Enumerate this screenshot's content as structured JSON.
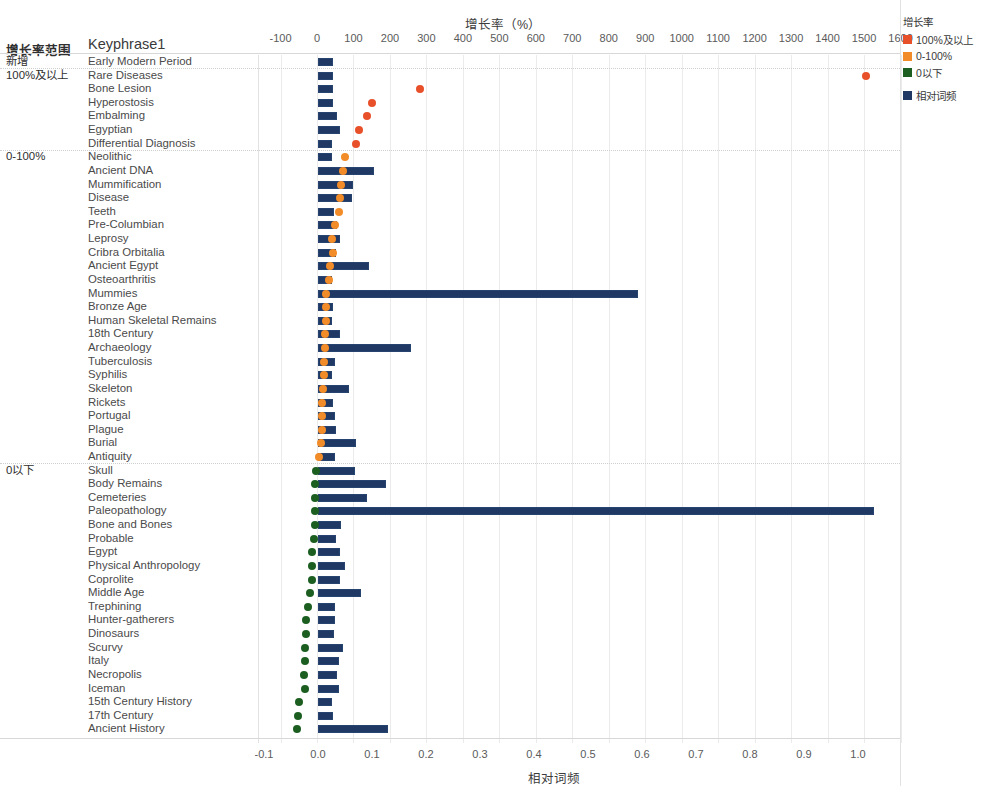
{
  "header": {
    "top_axis_title": "增长率（%）",
    "bottom_axis_title": "相对词频",
    "col_range_header": "增长率范围",
    "col_key_header": "Keyphrase1"
  },
  "legend": {
    "title": "增长率",
    "items": [
      {
        "label": "100%及以上",
        "color": "#e8502a"
      },
      {
        "label": "0-100%",
        "color": "#f28c28"
      },
      {
        "label": "0以下",
        "color": "#1b5e20"
      },
      {
        "label": "相对词频",
        "color": "#1f3864"
      }
    ]
  },
  "axes": {
    "top_ticks": [
      "-100",
      "0",
      "100",
      "200",
      "300",
      "400",
      "500",
      "600",
      "700",
      "800",
      "900",
      "1000",
      "1100",
      "1200",
      "1300",
      "1400",
      "1500",
      "1600"
    ],
    "bottom_ticks": [
      "-0.1",
      "0.0",
      "0.1",
      "0.2",
      "0.3",
      "0.4",
      "0.5",
      "0.6",
      "0.7",
      "0.8",
      "0.9",
      "1.0"
    ]
  },
  "groups": [
    {
      "label": "新增",
      "first_row": 0
    },
    {
      "label": "100%及以上",
      "first_row": 1
    },
    {
      "label": "0-100%",
      "first_row": 7
    },
    {
      "label": "0以下",
      "first_row": 30
    }
  ],
  "chart_data": {
    "type": "bar",
    "title": "增长率（%）",
    "xlabel": "相对词频",
    "ylabel": "Keyphrase1",
    "top_axis_label": "增长率（%）",
    "bottom_axis_label": "相对词频",
    "grid": true,
    "legend_position": "right",
    "top_axis_range": [
      -100,
      1600
    ],
    "bottom_axis_range": [
      -0.1,
      1.0
    ],
    "series": [
      {
        "name": "相对词频",
        "type": "bar",
        "color": "#1f3864",
        "axis": "bottom"
      },
      {
        "name": "增长率",
        "type": "scatter",
        "axis": "top"
      }
    ],
    "categories": [
      "Early Modern Period",
      "Rare Diseases",
      "Bone Lesion",
      "Hyperostosis",
      "Embalming",
      "Egyptian",
      "Differential Diagnosis",
      "Neolithic",
      "Ancient DNA",
      "Mummification",
      "Disease",
      "Teeth",
      "Pre-Columbian",
      "Leprosy",
      "Cribra Orbitalia",
      "Ancient Egypt",
      "Osteoarthritis",
      "Mummies",
      "Bronze Age",
      "Human Skeletal Remains",
      "18th Century",
      "Archaeology",
      "Tuberculosis",
      "Syphilis",
      "Skeleton",
      "Rickets",
      "Portugal",
      "Plague",
      "Burial",
      "Antiquity",
      "Skull",
      "Body Remains",
      "Cemeteries",
      "Paleopathology",
      "Bone and Bones",
      "Probable",
      "Egypt",
      "Physical Anthropology",
      "Coprolite",
      "Middle Age",
      "Trephining",
      "Hunter-gatherers",
      "Dinosaurs",
      "Scurvy",
      "Italy",
      "Necropolis",
      "Iceman",
      "15th Century History",
      "17th Century",
      "Ancient History"
    ],
    "rows": [
      {
        "keyphrase": "Early Modern Period",
        "group": "新增",
        "freq": 0.027,
        "growth": null,
        "growth_color": null
      },
      {
        "keyphrase": "Rare Diseases",
        "group": "100%及以上",
        "freq": 0.027,
        "growth": 1504,
        "growth_color": "#e8502a"
      },
      {
        "keyphrase": "Bone Lesion",
        "group": "100%及以上",
        "freq": 0.027,
        "growth": 283,
        "growth_color": "#e8502a"
      },
      {
        "keyphrase": "Hyperostosis",
        "group": "100%及以上",
        "freq": 0.028,
        "growth": 150,
        "growth_color": "#e8502a"
      },
      {
        "keyphrase": "Embalming",
        "group": "100%及以上",
        "freq": 0.036,
        "growth": 136,
        "growth_color": "#e8502a"
      },
      {
        "keyphrase": "Egyptian",
        "group": "100%及以上",
        "freq": 0.041,
        "growth": 116,
        "growth_color": "#e8502a"
      },
      {
        "keyphrase": "Differential Diagnosis",
        "group": "100%及以上",
        "freq": 0.025,
        "growth": 106,
        "growth_color": "#e8502a"
      },
      {
        "keyphrase": "Neolithic",
        "group": "0-100%",
        "freq": 0.026,
        "growth": 78,
        "growth_color": "#f28c28"
      },
      {
        "keyphrase": "Ancient DNA",
        "group": "0-100%",
        "freq": 0.104,
        "growth": 70,
        "growth_color": "#f28c28"
      },
      {
        "keyphrase": "Mummification",
        "group": "0-100%",
        "freq": 0.064,
        "growth": 65,
        "growth_color": "#f28c28"
      },
      {
        "keyphrase": "Disease",
        "group": "0-100%",
        "freq": 0.063,
        "growth": 63,
        "growth_color": "#f28c28"
      },
      {
        "keyphrase": "Teeth",
        "group": "0-100%",
        "freq": 0.029,
        "growth": 60,
        "growth_color": "#f28c28"
      },
      {
        "keyphrase": "Pre-Columbian",
        "group": "0-100%",
        "freq": 0.035,
        "growth": 48,
        "growth_color": "#f28c28"
      },
      {
        "keyphrase": "Leprosy",
        "group": "0-100%",
        "freq": 0.041,
        "growth": 41,
        "growth_color": "#f28c28"
      },
      {
        "keyphrase": "Cribra Orbitalia",
        "group": "0-100%",
        "freq": 0.034,
        "growth": 44,
        "growth_color": "#f28c28"
      },
      {
        "keyphrase": "Ancient Egypt",
        "group": "0-100%",
        "freq": 0.094,
        "growth": 35,
        "growth_color": "#f28c28"
      },
      {
        "keyphrase": "Osteoarthritis",
        "group": "0-100%",
        "freq": 0.026,
        "growth": 34,
        "growth_color": "#f28c28"
      },
      {
        "keyphrase": "Mummies",
        "group": "0-100%",
        "freq": 0.592,
        "growth": 26,
        "growth_color": "#f28c28"
      },
      {
        "keyphrase": "Bronze Age",
        "group": "0-100%",
        "freq": 0.027,
        "growth": 24,
        "growth_color": "#f28c28"
      },
      {
        "keyphrase": "Human Skeletal Remains",
        "group": "0-100%",
        "freq": 0.026,
        "growth": 24,
        "growth_color": "#f28c28"
      },
      {
        "keyphrase": "18th Century",
        "group": "0-100%",
        "freq": 0.04,
        "growth": 22,
        "growth_color": "#f28c28"
      },
      {
        "keyphrase": "Archaeology",
        "group": "0-100%",
        "freq": 0.172,
        "growth": 21,
        "growth_color": "#f28c28"
      },
      {
        "keyphrase": "Tuberculosis",
        "group": "0-100%",
        "freq": 0.032,
        "growth": 19,
        "growth_color": "#f28c28"
      },
      {
        "keyphrase": "Syphilis",
        "group": "0-100%",
        "freq": 0.026,
        "growth": 18,
        "growth_color": "#f28c28"
      },
      {
        "keyphrase": "Skeleton",
        "group": "0-100%",
        "freq": 0.058,
        "growth": 16,
        "growth_color": "#f28c28"
      },
      {
        "keyphrase": "Rickets",
        "group": "0-100%",
        "freq": 0.028,
        "growth": 15,
        "growth_color": "#f28c28"
      },
      {
        "keyphrase": "Portugal",
        "group": "0-100%",
        "freq": 0.031,
        "growth": 14,
        "growth_color": "#f28c28"
      },
      {
        "keyphrase": "Plague",
        "group": "0-100%",
        "freq": 0.033,
        "growth": 13,
        "growth_color": "#f28c28"
      },
      {
        "keyphrase": "Burial",
        "group": "0-100%",
        "freq": 0.07,
        "growth": 11,
        "growth_color": "#f28c28"
      },
      {
        "keyphrase": "Antiquity",
        "group": "0-100%",
        "freq": 0.031,
        "growth": 6,
        "growth_color": "#f28c28"
      },
      {
        "keyphrase": "Skull",
        "group": "0以下",
        "freq": 0.069,
        "growth": -3,
        "growth_color": "#1b5e20"
      },
      {
        "keyphrase": "Body Remains",
        "group": "0以下",
        "freq": 0.126,
        "growth": -5,
        "growth_color": "#1b5e20"
      },
      {
        "keyphrase": "Cemeteries",
        "group": "0以下",
        "freq": 0.091,
        "growth": -5,
        "growth_color": "#1b5e20"
      },
      {
        "keyphrase": "Paleopathology",
        "group": "0以下",
        "freq": 1.03,
        "growth": -6,
        "growth_color": "#1b5e20"
      },
      {
        "keyphrase": "Bone and Bones",
        "group": "0以下",
        "freq": 0.042,
        "growth": -6,
        "growth_color": "#1b5e20"
      },
      {
        "keyphrase": "Probable",
        "group": "0以下",
        "freq": 0.034,
        "growth": -8,
        "growth_color": "#1b5e20"
      },
      {
        "keyphrase": "Egypt",
        "group": "0以下",
        "freq": 0.041,
        "growth": -13,
        "growth_color": "#1b5e20"
      },
      {
        "keyphrase": "Physical Anthropology",
        "group": "0以下",
        "freq": 0.05,
        "growth": -14,
        "growth_color": "#1b5e20"
      },
      {
        "keyphrase": "Coprolite",
        "group": "0以下",
        "freq": 0.04,
        "growth": -15,
        "growth_color": "#1b5e20"
      },
      {
        "keyphrase": "Middle Age",
        "group": "0以下",
        "freq": 0.08,
        "growth": -20,
        "growth_color": "#1b5e20"
      },
      {
        "keyphrase": "Trephining",
        "group": "0以下",
        "freq": 0.031,
        "growth": -26,
        "growth_color": "#1b5e20"
      },
      {
        "keyphrase": "Hunter-gatherers",
        "group": "0以下",
        "freq": 0.032,
        "growth": -29,
        "growth_color": "#1b5e20"
      },
      {
        "keyphrase": "Dinosaurs",
        "group": "0以下",
        "freq": 0.03,
        "growth": -29,
        "growth_color": "#1b5e20"
      },
      {
        "keyphrase": "Scurvy",
        "group": "0以下",
        "freq": 0.046,
        "growth": -33,
        "growth_color": "#1b5e20"
      },
      {
        "keyphrase": "Italy",
        "group": "0以下",
        "freq": 0.038,
        "growth": -34,
        "growth_color": "#1b5e20"
      },
      {
        "keyphrase": "Necropolis",
        "group": "0以下",
        "freq": 0.036,
        "growth": -36,
        "growth_color": "#1b5e20"
      },
      {
        "keyphrase": "Iceman",
        "group": "0以下",
        "freq": 0.039,
        "growth": -33,
        "growth_color": "#1b5e20"
      },
      {
        "keyphrase": "15th Century History",
        "group": "0以下",
        "freq": 0.026,
        "growth": -48,
        "growth_color": "#1b5e20"
      },
      {
        "keyphrase": "17th Century",
        "group": "0以下",
        "freq": 0.027,
        "growth": -51,
        "growth_color": "#1b5e20"
      },
      {
        "keyphrase": "Ancient History",
        "group": "0以下",
        "freq": 0.13,
        "growth": -55,
        "growth_color": "#1b5e20"
      }
    ]
  }
}
